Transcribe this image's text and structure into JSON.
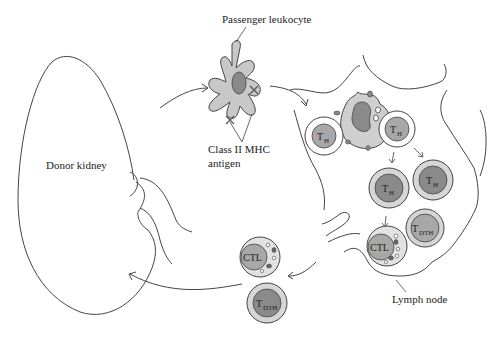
{
  "labels": {
    "passenger_leukocyte": "Passenger leukocyte",
    "class_ii_mhc_line1": "Class II MHC",
    "class_ii_mhc_line2": "antigen",
    "donor_kidney": "Donor kidney",
    "lymph_node": "Lymph node"
  },
  "cells": {
    "th_main": "T",
    "th_sub": "H",
    "tdth_main": "T",
    "tdth_sub": "DTH",
    "ctl": "CTL"
  },
  "colors": {
    "line": "#444444",
    "cell_fill_light": "#cfcfcf",
    "nucleus_dark": "#8a8a8a",
    "nucleus_mid": "#a8a8a8",
    "membrane_white": "#ffffff"
  }
}
